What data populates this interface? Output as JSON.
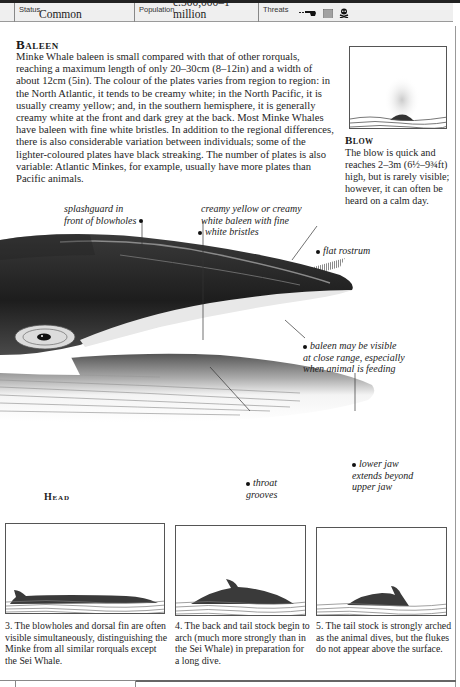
{
  "status_bar": {
    "status_label": "Status",
    "status_value": "Common",
    "population_label": "Population",
    "population_value": "c.500,000–1 million",
    "threats_label": "Threats",
    "threat_icons": [
      "whaling-harpoon-icon",
      "fishing-net-icon",
      "pollution-skull-icon"
    ]
  },
  "baleen": {
    "title": "Baleen",
    "body": "Minke Whale baleen is small compared with that of other rorquals, reaching a maximum length of only 20–30cm (8–12in) and a width of about 12cm (5in). The colour of the plates varies from region to region: in the North Atlantic, it tends to be creamy white; in the North Pacific, it is usually creamy yellow; and, in the southern hemisphere, it is generally creamy white at the front and dark grey at the back. Most Minke Whales have baleen with fine white bristles. In addition to the regional differences, there is also considerable variation between individuals; some of the lighter-coloured plates have black streaking. The number of plates is also variable: Atlantic Minkes, for example, usually have more plates than Pacific animals."
  },
  "blow": {
    "title": "Blow",
    "body": "The blow is quick and reaches 2–3m (6½–9¾ft) high, but is rarely visible; however, it can often be heard on a calm day."
  },
  "head_illustration": {
    "label": "Head",
    "annotations": {
      "splashguard": [
        "splashguard in",
        "front of blowholes"
      ],
      "baleen_color": [
        "creamy yellow or creamy",
        "white baleen with fine",
        "white bristles"
      ],
      "flat_rostrum": "flat rostrum",
      "baleen_visible": [
        "baleen may be visible",
        "at close range, especially",
        "when animal is feeding"
      ],
      "throat_grooves": [
        "throat",
        "grooves"
      ],
      "lower_jaw": [
        "lower jaw",
        "extends beyond",
        "upper jaw"
      ]
    }
  },
  "dive_sequence": [
    {
      "caption": "3. The blowholes and dorsal fin are often visible simultaneously, distinguishing the Minke from all similar rorquals except the Sei Whale."
    },
    {
      "caption": "4. The back and tail stock begin to arch (much more strongly than in the Sei Whale) in preparation for a long dive."
    },
    {
      "caption": "5. The tail stock is strongly arched as the animal dives, but the flukes do not appear above the surface."
    }
  ],
  "colors": {
    "ink": "#1a1a1a",
    "status_bg": "#efefef",
    "whale_dark": "#2a2a2a",
    "rule": "#888888"
  }
}
